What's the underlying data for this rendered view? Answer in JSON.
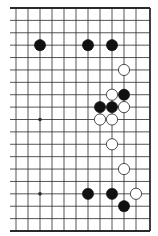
{
  "diagram": {
    "type": "go-board-partial",
    "colors": {
      "background": "#ffffff",
      "line": "#2a2a2a",
      "black_stone": "#111111",
      "white_stone": "#ffffff",
      "white_stone_outline": "#222222"
    },
    "grid": {
      "columns_visible": 12,
      "rows": 19,
      "edges": {
        "top": true,
        "bottom": true,
        "right": true,
        "left": false
      }
    },
    "star_points": [
      {
        "col": 2,
        "row": 9
      },
      {
        "col": 2,
        "row": 15
      }
    ],
    "stones": [
      {
        "color": "black",
        "col": 2,
        "row": 3
      },
      {
        "color": "black",
        "col": 6,
        "row": 3
      },
      {
        "color": "black",
        "col": 8,
        "row": 3
      },
      {
        "color": "white",
        "col": 9,
        "row": 5
      },
      {
        "color": "white",
        "col": 8,
        "row": 7
      },
      {
        "color": "black",
        "col": 9,
        "row": 7
      },
      {
        "color": "black",
        "col": 7,
        "row": 8
      },
      {
        "color": "black",
        "col": 8,
        "row": 8
      },
      {
        "color": "white",
        "col": 9,
        "row": 8
      },
      {
        "color": "white",
        "col": 7,
        "row": 9
      },
      {
        "color": "white",
        "col": 8,
        "row": 9
      },
      {
        "color": "white",
        "col": 8,
        "row": 11
      },
      {
        "color": "white",
        "col": 9,
        "row": 13
      },
      {
        "color": "black",
        "col": 6,
        "row": 15
      },
      {
        "color": "black",
        "col": 8,
        "row": 15
      },
      {
        "color": "white",
        "col": 10,
        "row": 15
      },
      {
        "color": "black",
        "col": 9,
        "row": 16
      }
    ]
  }
}
